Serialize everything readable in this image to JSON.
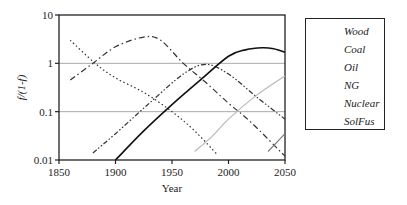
{
  "chart_data": {
    "type": "line",
    "title": "",
    "xlabel": "Year",
    "ylabel": "f/(1-f)",
    "yscale": "log",
    "xlim": [
      1850,
      2050
    ],
    "ylim": [
      0.01,
      10
    ],
    "x_ticks": [
      "1850",
      "1900",
      "1950",
      "2000",
      "2050"
    ],
    "y_ticks": [
      "0.01",
      "0.1",
      "1",
      "10"
    ],
    "grid": "horizontal at 0.1 and 1",
    "legend_position": "right",
    "series": [
      {
        "name": "Wood",
        "style": "dotted",
        "color": "#333333",
        "x": [
          1860,
          1882,
          1900,
          1925,
          1950,
          1970,
          1990
        ],
        "y": [
          3.0,
          1.0,
          0.5,
          0.25,
          0.1,
          0.04,
          0.013
        ]
      },
      {
        "name": "Coal",
        "style": "dash-dot",
        "color": "#333333",
        "x": [
          1860,
          1880,
          1900,
          1925,
          1940,
          1960,
          1980,
          2000,
          2020,
          2050
        ],
        "y": [
          0.45,
          1.0,
          2.2,
          3.5,
          3.0,
          1.0,
          0.4,
          0.15,
          0.06,
          0.012
        ]
      },
      {
        "name": "Oil",
        "style": "dash-dot-dot",
        "color": "#333333",
        "x": [
          1880,
          1900,
          1930,
          1960,
          1980,
          2000,
          2025,
          2050
        ],
        "y": [
          0.014,
          0.035,
          0.15,
          0.6,
          0.95,
          0.6,
          0.2,
          0.07
        ]
      },
      {
        "name": "NG",
        "style": "solid",
        "color": "#111111",
        "x": [
          1900,
          1925,
          1950,
          1975,
          2000,
          2015,
          2030,
          2040,
          2050
        ],
        "y": [
          0.01,
          0.04,
          0.14,
          0.45,
          1.4,
          1.9,
          2.1,
          2.0,
          1.7
        ]
      },
      {
        "name": "Nuclear",
        "style": "solid",
        "color": "#b8b8b8",
        "x": [
          1970,
          1985,
          2000,
          2025,
          2050
        ],
        "y": [
          0.015,
          0.03,
          0.07,
          0.22,
          0.55
        ]
      },
      {
        "name": "SolFus",
        "style": "solid",
        "color": "#7a7a7a",
        "x": [
          2035,
          2050
        ],
        "y": [
          0.015,
          0.035
        ]
      }
    ]
  },
  "legend": {
    "items": [
      "Wood",
      "Coal",
      "Oil",
      "NG",
      "Nuclear",
      "SolFus"
    ]
  },
  "axes": {
    "xlabel": "Year",
    "ylabel": "f/(1-f)"
  }
}
